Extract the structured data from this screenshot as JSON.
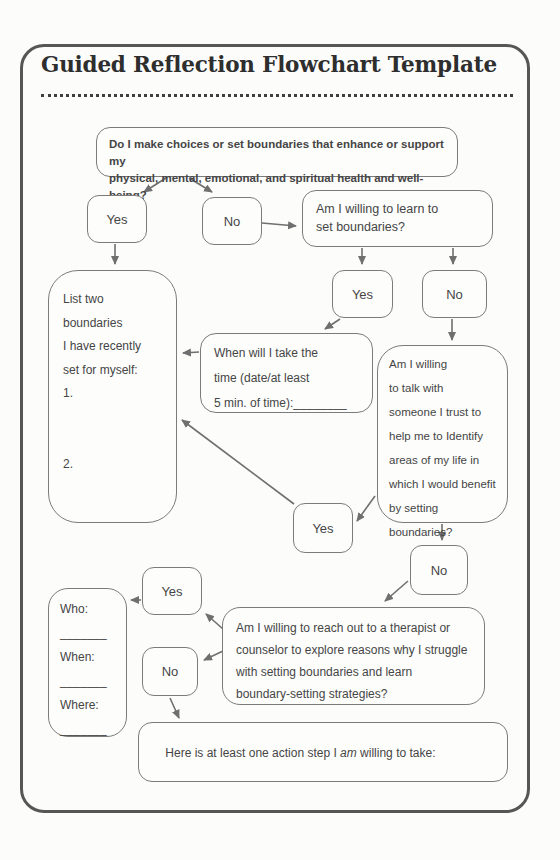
{
  "title": "Guided Reflection Flowchart Template",
  "nodes": {
    "q_main": {
      "lines": [
        "Do I make choices or set boundaries that enhance or support my",
        "physical, mental, emotional, and spiritual health and well-being?"
      ]
    },
    "yes1": {
      "label": "Yes"
    },
    "no1": {
      "label": "No"
    },
    "q_learn": {
      "lines": [
        "Am I willing to learn to",
        "set boundaries?"
      ]
    },
    "list_boundaries": {
      "lines": [
        "List two boundaries",
        "I have recently",
        "set for myself:",
        "1.",
        "",
        "",
        "2."
      ]
    },
    "when_time": {
      "lines": [
        "When will I take the",
        "time (date/at least",
        "5 min. of time):________"
      ]
    },
    "yes2": {
      "label": "Yes"
    },
    "no2": {
      "label": "No"
    },
    "q_talk": {
      "lines": [
        "Am I willing",
        "to talk with",
        "someone I trust to",
        "help me to Identify",
        "areas of my life in",
        "which I would benefit",
        "by setting boundaries?"
      ]
    },
    "yes3": {
      "label": "Yes"
    },
    "no3": {
      "label": "No"
    },
    "who_when_where": {
      "lines": [
        "Who:",
        "_______",
        "When:",
        "_______",
        "Where:",
        "_______"
      ]
    },
    "yes4": {
      "label": "Yes"
    },
    "no4": {
      "label": "No"
    },
    "q_therapist": {
      "lines": [
        "Am I willing to reach out to a therapist or",
        "counselor to explore reasons why I struggle",
        "with setting boundaries and learn",
        "boundary-setting strategies?"
      ]
    },
    "action_step": {
      "prefix": "Here is at least one action step I ",
      "emphasis": "am",
      "suffix": " willing to take:"
    }
  },
  "colors": {
    "page_background": "#fcfcfb",
    "frame_border": "#565656",
    "box_border": "#7b7b7b",
    "text": "#454545",
    "title_text": "#2e2e2e",
    "arrow": "#6f6f6f"
  }
}
